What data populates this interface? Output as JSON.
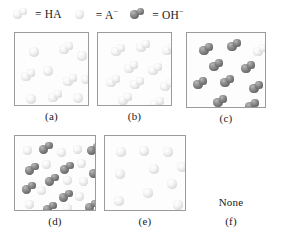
{
  "legend": {
    "entries": [
      {
        "icon": "molecule-pale-icon",
        "species": "HA",
        "label": "= HA",
        "type": "molecule",
        "color": "#ececec"
      },
      {
        "icon": "sphere-pale-icon",
        "species": "A-",
        "label": "= A",
        "sup": "−",
        "type": "sphere",
        "color": "#ececec"
      },
      {
        "icon": "molecule-dark-icon",
        "species": "OH-",
        "label": "= OH",
        "sup": "−",
        "type": "molecule",
        "color": "#7d7d7d"
      }
    ]
  },
  "panels": [
    {
      "id": "a",
      "caption": "(a)",
      "particles": [
        {
          "type": "sphere",
          "shade": "pale",
          "x": 14,
          "y": 14,
          "r": 5.0
        },
        {
          "type": "molecule",
          "shade": "pale",
          "x": 44,
          "y": 9,
          "r": 4.8
        },
        {
          "type": "sphere",
          "shade": "pale",
          "x": 62,
          "y": 18,
          "r": 5.0
        },
        {
          "type": "molecule",
          "shade": "pale",
          "x": 6,
          "y": 36,
          "r": 4.8
        },
        {
          "type": "sphere",
          "shade": "pale",
          "x": 28,
          "y": 33,
          "r": 5.0
        },
        {
          "type": "molecule",
          "shade": "pale",
          "x": 48,
          "y": 41,
          "r": 4.8
        },
        {
          "type": "molecule",
          "shade": "pale",
          "x": 66,
          "y": 39,
          "r": 4.6
        },
        {
          "type": "sphere",
          "shade": "pale",
          "x": 11,
          "y": 61,
          "r": 5.0
        },
        {
          "type": "molecule",
          "shade": "pale",
          "x": 33,
          "y": 57,
          "r": 4.8
        },
        {
          "type": "sphere",
          "shade": "pale",
          "x": 58,
          "y": 60,
          "r": 5.0
        }
      ]
    },
    {
      "id": "b",
      "caption": "(b)",
      "particles": [
        {
          "type": "molecule",
          "shade": "pale",
          "x": 13,
          "y": 11,
          "r": 4.8
        },
        {
          "type": "molecule",
          "shade": "pale",
          "x": 38,
          "y": 7,
          "r": 4.8
        },
        {
          "type": "molecule",
          "shade": "pale",
          "x": 64,
          "y": 10,
          "r": 4.8
        },
        {
          "type": "molecule",
          "shade": "pale",
          "x": 26,
          "y": 28,
          "r": 4.8
        },
        {
          "type": "molecule",
          "shade": "pale",
          "x": 50,
          "y": 30,
          "r": 4.8
        },
        {
          "type": "molecule",
          "shade": "pale",
          "x": 8,
          "y": 42,
          "r": 4.8
        },
        {
          "type": "molecule",
          "shade": "pale",
          "x": 32,
          "y": 44,
          "r": 4.8
        },
        {
          "type": "molecule",
          "shade": "pale",
          "x": 62,
          "y": 46,
          "r": 4.8
        },
        {
          "type": "molecule",
          "shade": "pale",
          "x": 20,
          "y": 60,
          "r": 4.8
        },
        {
          "type": "molecule",
          "shade": "pale",
          "x": 52,
          "y": 64,
          "r": 4.8
        }
      ]
    },
    {
      "id": "c",
      "caption": "(c)",
      "particles": [
        {
          "type": "molecule",
          "shade": "dark",
          "x": 12,
          "y": 10,
          "r": 4.8
        },
        {
          "type": "molecule",
          "shade": "dark",
          "x": 40,
          "y": 6,
          "r": 4.8
        },
        {
          "type": "molecule",
          "shade": "pale",
          "x": 66,
          "y": 11,
          "r": 4.8
        },
        {
          "type": "molecule",
          "shade": "dark",
          "x": 22,
          "y": 26,
          "r": 4.8
        },
        {
          "type": "molecule",
          "shade": "dark",
          "x": 54,
          "y": 28,
          "r": 4.8
        },
        {
          "type": "molecule",
          "shade": "dark",
          "x": 6,
          "y": 44,
          "r": 4.8
        },
        {
          "type": "molecule",
          "shade": "dark",
          "x": 33,
          "y": 42,
          "r": 4.8
        },
        {
          "type": "molecule",
          "shade": "dark",
          "x": 62,
          "y": 48,
          "r": 4.8
        },
        {
          "type": "molecule",
          "shade": "dark",
          "x": 26,
          "y": 62,
          "r": 4.8
        },
        {
          "type": "molecule",
          "shade": "dark",
          "x": 58,
          "y": 66,
          "r": 4.8
        }
      ]
    },
    {
      "id": "d",
      "caption": "(d)",
      "particles": [
        {
          "type": "sphere",
          "shade": "pale",
          "x": 8,
          "y": 10,
          "r": 4.6
        },
        {
          "type": "molecule",
          "shade": "dark",
          "x": 24,
          "y": 6,
          "r": 4.6
        },
        {
          "type": "sphere",
          "shade": "pale",
          "x": 42,
          "y": 12,
          "r": 4.6
        },
        {
          "type": "sphere",
          "shade": "pale",
          "x": 58,
          "y": 9,
          "r": 4.6
        },
        {
          "type": "molecule",
          "shade": "dark",
          "x": 72,
          "y": 7,
          "r": 4.6
        },
        {
          "type": "molecule",
          "shade": "dark",
          "x": 10,
          "y": 27,
          "r": 4.6
        },
        {
          "type": "sphere",
          "shade": "pale",
          "x": 27,
          "y": 24,
          "r": 4.6
        },
        {
          "type": "molecule",
          "shade": "dark",
          "x": 45,
          "y": 26,
          "r": 4.6
        },
        {
          "type": "sphere",
          "shade": "pale",
          "x": 62,
          "y": 23,
          "r": 4.6
        },
        {
          "type": "molecule",
          "shade": "dark",
          "x": 74,
          "y": 30,
          "r": 4.6
        },
        {
          "type": "molecule",
          "shade": "dark",
          "x": 30,
          "y": 38,
          "r": 4.6
        },
        {
          "type": "sphere",
          "shade": "pale",
          "x": 48,
          "y": 40,
          "r": 4.6
        },
        {
          "type": "sphere",
          "shade": "pale",
          "x": 64,
          "y": 41,
          "r": 4.6
        },
        {
          "type": "molecule",
          "shade": "dark",
          "x": 7,
          "y": 46,
          "r": 4.6
        },
        {
          "type": "sphere",
          "shade": "pale",
          "x": 22,
          "y": 50,
          "r": 4.6
        },
        {
          "type": "molecule",
          "shade": "dark",
          "x": 44,
          "y": 54,
          "r": 4.6
        },
        {
          "type": "sphere",
          "shade": "pale",
          "x": 60,
          "y": 56,
          "r": 4.6
        },
        {
          "type": "sphere",
          "shade": "pale",
          "x": 10,
          "y": 64,
          "r": 4.6
        },
        {
          "type": "molecule",
          "shade": "dark",
          "x": 28,
          "y": 66,
          "r": 4.6
        },
        {
          "type": "sphere",
          "shade": "pale",
          "x": 48,
          "y": 68,
          "r": 4.6
        },
        {
          "type": "molecule",
          "shade": "dark",
          "x": 70,
          "y": 64,
          "r": 4.6
        }
      ]
    },
    {
      "id": "e",
      "caption": "(e)",
      "particles": [
        {
          "type": "sphere",
          "shade": "pale",
          "x": 11,
          "y": 11,
          "r": 4.8
        },
        {
          "type": "sphere",
          "shade": "pale",
          "x": 34,
          "y": 10,
          "r": 4.8
        },
        {
          "type": "sphere",
          "shade": "pale",
          "x": 58,
          "y": 11,
          "r": 4.8
        },
        {
          "type": "sphere",
          "shade": "pale",
          "x": 44,
          "y": 28,
          "r": 4.8
        },
        {
          "type": "sphere",
          "shade": "pale",
          "x": 72,
          "y": 26,
          "r": 4.8
        },
        {
          "type": "sphere",
          "shade": "pale",
          "x": 10,
          "y": 33,
          "r": 4.8
        },
        {
          "type": "sphere",
          "shade": "pale",
          "x": 62,
          "y": 43,
          "r": 4.8
        },
        {
          "type": "sphere",
          "shade": "pale",
          "x": 38,
          "y": 52,
          "r": 4.8
        },
        {
          "type": "sphere",
          "shade": "pale",
          "x": 9,
          "y": 60,
          "r": 4.8
        },
        {
          "type": "sphere",
          "shade": "pale",
          "x": 68,
          "y": 64,
          "r": 4.8
        }
      ]
    }
  ],
  "none_option": {
    "text": "None",
    "caption": "(f)"
  }
}
